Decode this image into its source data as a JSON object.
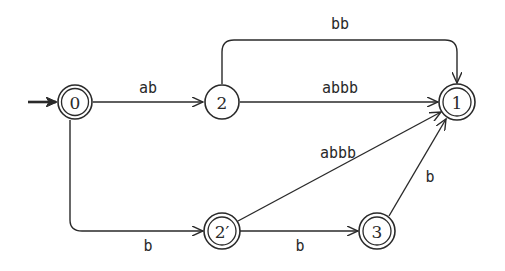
{
  "diagram": {
    "type": "finite-automaton",
    "start_state": "0",
    "nodes": [
      {
        "id": "0",
        "label": "0",
        "accepting": true,
        "x": 75,
        "y": 102
      },
      {
        "id": "2",
        "label": "2",
        "accepting": false,
        "x": 222,
        "y": 102
      },
      {
        "id": "1",
        "label": "1",
        "accepting": true,
        "x": 457,
        "y": 102
      },
      {
        "id": "2p",
        "label": "2′",
        "accepting": true,
        "x": 222,
        "y": 231
      },
      {
        "id": "3",
        "label": "3",
        "accepting": true,
        "x": 377,
        "y": 231
      }
    ],
    "edges": [
      {
        "from": "0",
        "to": "2",
        "label": "ab"
      },
      {
        "from": "2",
        "to": "1",
        "label": "bb",
        "route": "over-top"
      },
      {
        "from": "2",
        "to": "1",
        "label": "abbb"
      },
      {
        "from": "0",
        "to": "2p",
        "label": "b",
        "route": "down-then-right"
      },
      {
        "from": "2p",
        "to": "1",
        "label": "abbb"
      },
      {
        "from": "2p",
        "to": "3",
        "label": "b"
      },
      {
        "from": "3",
        "to": "1",
        "label": "b"
      }
    ]
  }
}
